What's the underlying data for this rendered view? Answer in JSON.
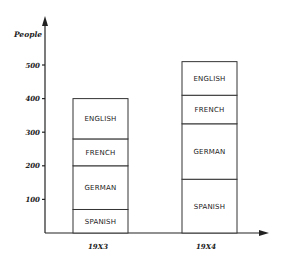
{
  "chart_data": {
    "type": "bar",
    "stacked": true,
    "title": "",
    "xlabel": "",
    "ylabel": "People",
    "ylim": [
      0,
      550
    ],
    "yticks": [
      100,
      200,
      300,
      400,
      500
    ],
    "ytick_labels": [
      "100",
      "200",
      "300",
      "400",
      "500"
    ],
    "grid": false,
    "legend": "labels inside segments",
    "categories": [
      "19X3",
      "19X4"
    ],
    "series": [
      {
        "name": "SPANISH",
        "values": [
          70,
          160
        ]
      },
      {
        "name": "GERMAN",
        "values": [
          130,
          165
        ]
      },
      {
        "name": "FRENCH",
        "values": [
          80,
          85
        ]
      },
      {
        "name": "ENGLISH",
        "values": [
          120,
          100
        ]
      }
    ],
    "totals": [
      400,
      510
    ]
  }
}
